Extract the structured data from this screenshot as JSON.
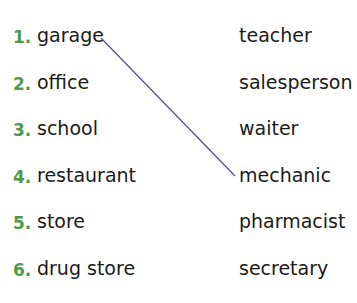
{
  "exercise": {
    "places": [
      {
        "number": "1.",
        "label": "garage"
      },
      {
        "number": "2.",
        "label": "office"
      },
      {
        "number": "3.",
        "label": "school"
      },
      {
        "number": "4.",
        "label": "restaurant"
      },
      {
        "number": "5.",
        "label": "store"
      },
      {
        "number": "6.",
        "label": "drug store"
      }
    ],
    "jobs": [
      "teacher",
      "salesperson",
      "waiter",
      "mechanic",
      "pharmacist",
      "secretary"
    ],
    "matches": [
      {
        "place": "garage",
        "job": "mechanic"
      }
    ],
    "colors": {
      "number": "#4e9a4e",
      "line": "#4a4f8a",
      "text": "#1a1a1a"
    }
  }
}
